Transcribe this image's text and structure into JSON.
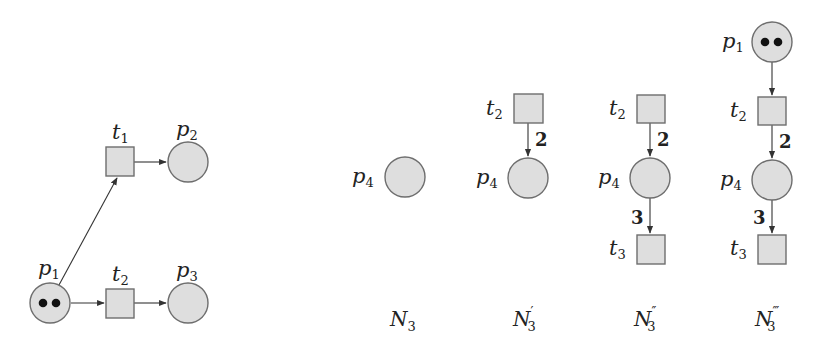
{
  "colors": {
    "node_fill": "#dedede",
    "node_stroke": "#6e6e6e",
    "arc": "#333333",
    "token": "#111111"
  },
  "left_net": {
    "places": [
      {
        "id": "p1",
        "base": "p",
        "sub": "1",
        "tokens": 2
      },
      {
        "id": "p2",
        "base": "p",
        "sub": "2",
        "tokens": 0
      },
      {
        "id": "p3",
        "base": "p",
        "sub": "3",
        "tokens": 0
      }
    ],
    "transitions": [
      {
        "id": "t1",
        "base": "t",
        "sub": "1"
      },
      {
        "id": "t2",
        "base": "t",
        "sub": "2"
      }
    ],
    "arcs": [
      {
        "from": "p1",
        "to": "t1"
      },
      {
        "from": "t1",
        "to": "p2"
      },
      {
        "from": "p1",
        "to": "t2"
      },
      {
        "from": "t2",
        "to": "p3"
      }
    ]
  },
  "nets": [
    {
      "name": "N",
      "sub": "3",
      "prime": "",
      "places": [
        {
          "id": "p4",
          "base": "p",
          "sub": "4"
        }
      ],
      "transitions": [],
      "arcs": []
    },
    {
      "name": "N",
      "sub": "3",
      "prime": "′",
      "places": [
        {
          "id": "p4",
          "base": "p",
          "sub": "4"
        }
      ],
      "transitions": [
        {
          "id": "t2",
          "base": "t",
          "sub": "2"
        }
      ],
      "arcs": [
        {
          "from": "t2",
          "to": "p4",
          "weight": "2"
        }
      ]
    },
    {
      "name": "N",
      "sub": "3",
      "prime": "″",
      "places": [
        {
          "id": "p4",
          "base": "p",
          "sub": "4"
        }
      ],
      "transitions": [
        {
          "id": "t2",
          "base": "t",
          "sub": "2"
        },
        {
          "id": "t3",
          "base": "t",
          "sub": "3"
        }
      ],
      "arcs": [
        {
          "from": "t2",
          "to": "p4",
          "weight": "2"
        },
        {
          "from": "p4",
          "to": "t3",
          "weight": "3"
        }
      ]
    },
    {
      "name": "N",
      "sub": "3",
      "prime": "‴",
      "places": [
        {
          "id": "p1",
          "base": "p",
          "sub": "1",
          "tokens": 2
        },
        {
          "id": "p4",
          "base": "p",
          "sub": "4"
        }
      ],
      "transitions": [
        {
          "id": "t2",
          "base": "t",
          "sub": "2"
        },
        {
          "id": "t3",
          "base": "t",
          "sub": "3"
        }
      ],
      "arcs": [
        {
          "from": "p1",
          "to": "t2"
        },
        {
          "from": "t2",
          "to": "p4",
          "weight": "2"
        },
        {
          "from": "p4",
          "to": "t3",
          "weight": "3"
        }
      ]
    }
  ]
}
